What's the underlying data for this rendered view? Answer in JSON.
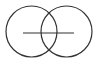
{
  "diagram": {
    "stroke_color": "#333333",
    "background": "#ffffff",
    "shapes": {
      "left_circle": {
        "cx": 31.5,
        "cy": 31.5,
        "r": 25.5
      },
      "right_circle": {
        "cx": 66.5,
        "cy": 31.5,
        "r": 25.5
      },
      "horizontal_line": {
        "x1": 23,
        "y1": 33,
        "x2": 74,
        "y2": 33
      }
    }
  }
}
